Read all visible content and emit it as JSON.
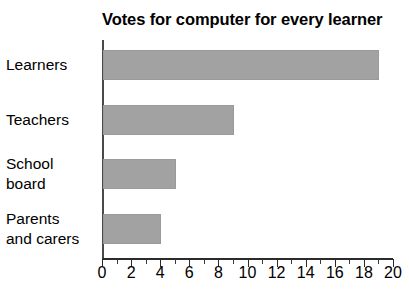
{
  "chart_data": {
    "type": "bar",
    "orientation": "horizontal",
    "title": "Votes for computer for every learner",
    "xlabel": "",
    "ylabel": "",
    "categories": [
      "Learners",
      "Teachers",
      "School board",
      "Parents and carers"
    ],
    "values": [
      19,
      9,
      5,
      4
    ],
    "xlim": [
      0,
      20
    ],
    "xticks": [
      0,
      2,
      4,
      6,
      8,
      10,
      12,
      14,
      16,
      18,
      20
    ],
    "xtick_labels": [
      "0",
      "2",
      "4",
      "6",
      "8",
      "10",
      "12",
      "14",
      "16",
      "18",
      "20"
    ],
    "minor_tick_step": 1,
    "grid": false,
    "legend": null,
    "bar_color": "#a2a2a2",
    "axis_color": "#2b2b2b",
    "text_color": "#000000",
    "background": "#ffffff"
  },
  "category_label_lines": [
    [
      "Learners"
    ],
    [
      "Teachers"
    ],
    [
      "School",
      "board"
    ],
    [
      "Parents",
      "and carers"
    ]
  ]
}
